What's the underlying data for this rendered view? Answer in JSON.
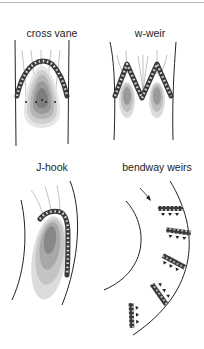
{
  "panels": [
    {
      "id": "cross-vane",
      "label": "cross vane"
    },
    {
      "id": "w-weir",
      "label": "w-weir"
    },
    {
      "id": "j-hook",
      "label": "J-hook"
    },
    {
      "id": "bendway-weirs",
      "label": "bendway weirs"
    }
  ],
  "colors": {
    "bank_line": "#222222",
    "rock": "#3a3a3a",
    "rock_highlight": "#d8d8d8",
    "flow_line": "#888888",
    "scour_levels": [
      "#e6e6e6",
      "#cfcfcf",
      "#b5b5b5",
      "#9a9a9a",
      "#7e7e7e"
    ]
  }
}
